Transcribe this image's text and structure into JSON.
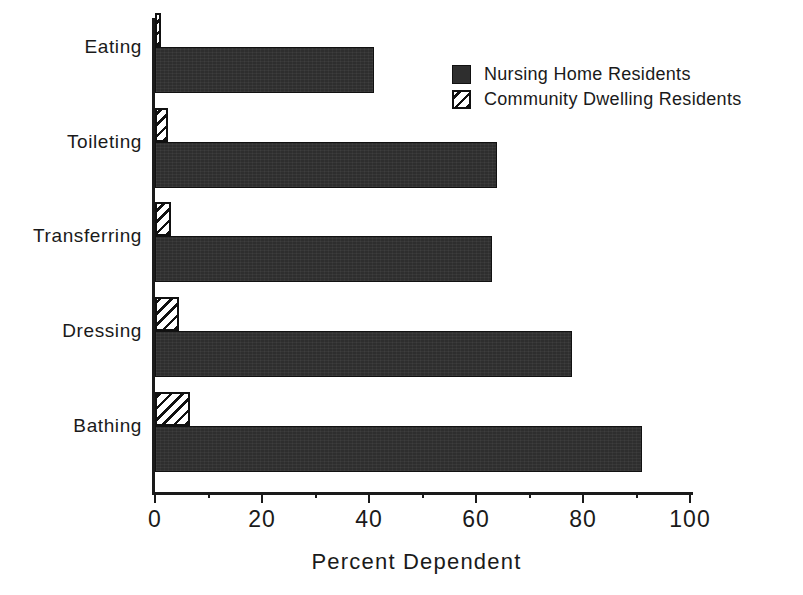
{
  "chart_data": {
    "type": "bar",
    "orientation": "horizontal",
    "title": "",
    "xlabel": "Percent Dependent",
    "ylabel": "",
    "xlim": [
      0,
      100
    ],
    "xticks": [
      0,
      20,
      40,
      60,
      80,
      100
    ],
    "xtick_labels": [
      "0",
      "20",
      "40",
      "60",
      "80",
      "100"
    ],
    "minor_xticks": [
      10,
      30,
      50,
      70,
      90
    ],
    "grid": false,
    "legend_position": "top-right-inside",
    "categories": [
      "Eating",
      "Toileting",
      "Transferring",
      "Dressing",
      "Bathing"
    ],
    "series": [
      {
        "name": "Nursing Home Residents",
        "style": "solid",
        "color": "#2e2e2e",
        "values": [
          41,
          64,
          63,
          78,
          91
        ]
      },
      {
        "name": "Community Dwelling Residents",
        "style": "diagonal-hatch",
        "color": "#111111",
        "values": [
          1,
          2.5,
          3,
          4.5,
          6.5
        ]
      }
    ]
  },
  "axis": {
    "x_title": "Percent Dependent"
  },
  "legend": {
    "entries": [
      {
        "label": "Nursing Home Residents",
        "swatch": "solid-fill-swatch"
      },
      {
        "label": "Community Dwelling Residents",
        "swatch": "hatched-fill-swatch"
      }
    ]
  }
}
